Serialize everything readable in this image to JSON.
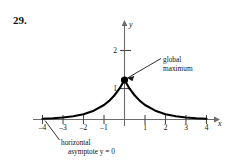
{
  "problem": {
    "number": "29."
  },
  "chart_data": {
    "type": "line",
    "title": "",
    "xlabel": "x",
    "ylabel": "y",
    "xlim": [
      -4.4,
      4.4
    ],
    "ylim": [
      -0.25,
      2.55
    ],
    "grid": false,
    "legend": null,
    "function": "y = e^(-|x|)",
    "x_ticks": [
      -4,
      -3,
      -2,
      -1,
      1,
      2,
      3,
      4
    ],
    "x_tick_labels": [
      "–4",
      "–3",
      "–2",
      "–1",
      "1",
      "2",
      "3",
      "4"
    ],
    "y_ticks": [
      1,
      2
    ],
    "y_tick_labels": [
      "1",
      "2"
    ],
    "series": [
      {
        "name": "y = e^(-|x|)",
        "x": [
          -4,
          -3.5,
          -3,
          -2.5,
          -2,
          -1.5,
          -1,
          -0.75,
          -0.5,
          -0.25,
          0,
          0.25,
          0.5,
          0.75,
          1,
          1.5,
          2,
          2.5,
          3,
          3.5,
          4
        ],
        "values": [
          0.018,
          0.03,
          0.05,
          0.082,
          0.135,
          0.223,
          0.368,
          0.472,
          0.607,
          0.779,
          1.0,
          0.779,
          0.607,
          0.472,
          0.368,
          0.223,
          0.135,
          0.082,
          0.05,
          0.03,
          0.018
        ]
      }
    ],
    "points": [
      {
        "name": "global-maximum",
        "x": 0,
        "y": 1,
        "marker": "filled-circle"
      }
    ],
    "annotations": [
      {
        "name": "global-maximum-label",
        "line1": "global",
        "line2": "maximum",
        "target_x": 0,
        "target_y": 1
      },
      {
        "name": "horizontal-asymptote-label",
        "line1": "horizontal",
        "line2": "asymptote y = 0",
        "target_x": -3.6,
        "target_y": 0
      }
    ]
  },
  "colors": {
    "curve": "#000000",
    "axis": "#6b6b6b",
    "text": "#111111",
    "background": "#ffffff"
  }
}
